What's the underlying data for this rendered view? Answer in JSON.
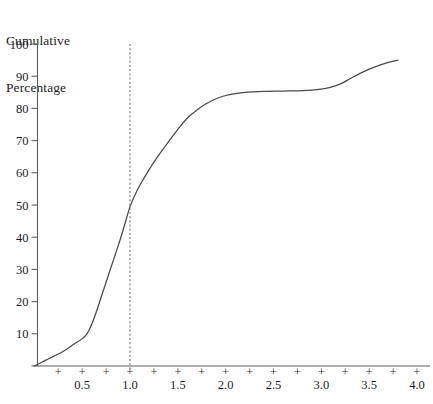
{
  "chart_data": {
    "type": "line",
    "title": "Cumulative Percentage",
    "title_line1": "Cumulative",
    "title_line2": "Percentage",
    "xlabel": "",
    "ylabel": "Cumulative Percentage",
    "xlim": [
      0,
      4.15
    ],
    "ylim": [
      0,
      100
    ],
    "grid": false,
    "legend": null,
    "y_ticks": [
      0,
      10,
      20,
      30,
      40,
      50,
      60,
      70,
      80,
      90,
      100
    ],
    "y_tick_labels": [
      "",
      "10",
      "20",
      "30",
      "40",
      "50",
      "60",
      "70",
      "80",
      "90",
      "100"
    ],
    "x_ticks": [
      0.25,
      0.5,
      0.75,
      1.0,
      1.25,
      1.5,
      1.75,
      2.0,
      2.25,
      2.5,
      2.75,
      3.0,
      3.25,
      3.5,
      3.75,
      4.0
    ],
    "x_tick_marker": "+",
    "x_tick_labels": [
      {
        "value": 0.5,
        "label": "0.5"
      },
      {
        "value": 1.0,
        "label": "1.0"
      },
      {
        "value": 1.5,
        "label": "1.5"
      },
      {
        "value": 2.0,
        "label": "2.0"
      },
      {
        "value": 2.5,
        "label": "2.5"
      },
      {
        "value": 3.0,
        "label": "3.0"
      },
      {
        "value": 3.5,
        "label": "3.5"
      },
      {
        "value": 4.0,
        "label": "4.0"
      }
    ],
    "annotations": [
      {
        "name": "median-reference-line",
        "type": "vline",
        "x": 1.0,
        "style": "dashed",
        "color": "#6a6a6a"
      }
    ],
    "series": [
      {
        "name": "cumulative percentage",
        "color": "#4a4a4a",
        "x": [
          0.0,
          0.1,
          0.2,
          0.3,
          0.4,
          0.5,
          0.55,
          0.6,
          0.65,
          0.7,
          0.75,
          0.8,
          0.85,
          0.9,
          0.95,
          1.0,
          1.05,
          1.1,
          1.2,
          1.3,
          1.4,
          1.5,
          1.6,
          1.7,
          1.8,
          1.9,
          2.0,
          2.1,
          2.2,
          2.4,
          2.6,
          2.8,
          3.0,
          3.1,
          3.2,
          3.3,
          3.4,
          3.5,
          3.6,
          3.7,
          3.8
        ],
        "y": [
          0.0,
          1.5,
          3.0,
          4.5,
          6.5,
          8.5,
          10.0,
          13.0,
          17.0,
          21.5,
          26.0,
          30.5,
          35.0,
          39.5,
          44.5,
          49.5,
          53.0,
          56.0,
          61.0,
          65.5,
          69.5,
          73.5,
          77.0,
          79.5,
          81.5,
          83.0,
          84.0,
          84.6,
          85.0,
          85.3,
          85.4,
          85.5,
          86.0,
          86.6,
          87.6,
          89.2,
          90.8,
          92.2,
          93.3,
          94.3,
          95.0
        ]
      }
    ],
    "key_points": [
      {
        "name": "origin",
        "x": 0.0,
        "y": 0.0
      },
      {
        "name": "median",
        "x": 1.0,
        "y": 50.0
      },
      {
        "name": "plateau-start",
        "x": 2.0,
        "y": 84.0
      },
      {
        "name": "plateau-end",
        "x": 3.0,
        "y": 86.0
      },
      {
        "name": "curve-end",
        "x": 3.8,
        "y": 95.0
      }
    ]
  },
  "xaxis_caption": ""
}
